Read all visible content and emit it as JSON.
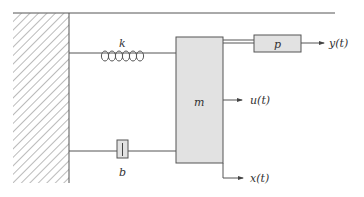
{
  "figure": {
    "type": "mass-spring-damper schematic",
    "colors": {
      "line": "#555555",
      "hatch": "#777777",
      "block_fill": "#e2e2e2",
      "block_stroke": "#555555",
      "text": "#333333",
      "background": "#ffffff"
    }
  },
  "labels": {
    "spring": "k",
    "damper": "b",
    "mass": "m",
    "sensor": "p",
    "output_y": "y(t)",
    "input_u": "u(t)",
    "output_x": "x(t)"
  },
  "components": [
    {
      "id": "wall",
      "kind": "fixed ground (hatched)"
    },
    {
      "id": "spring",
      "kind": "spring",
      "label": "k"
    },
    {
      "id": "damper",
      "kind": "dashpot",
      "label": "b"
    },
    {
      "id": "mass",
      "kind": "mass block",
      "label": "m"
    },
    {
      "id": "sensor",
      "kind": "block",
      "label": "p"
    }
  ],
  "signals": [
    {
      "name": "y(t)",
      "direction": "output",
      "from": "p"
    },
    {
      "name": "u(t)",
      "direction": "input arrow",
      "from": "m"
    },
    {
      "name": "x(t)",
      "direction": "output",
      "from": "m"
    }
  ]
}
